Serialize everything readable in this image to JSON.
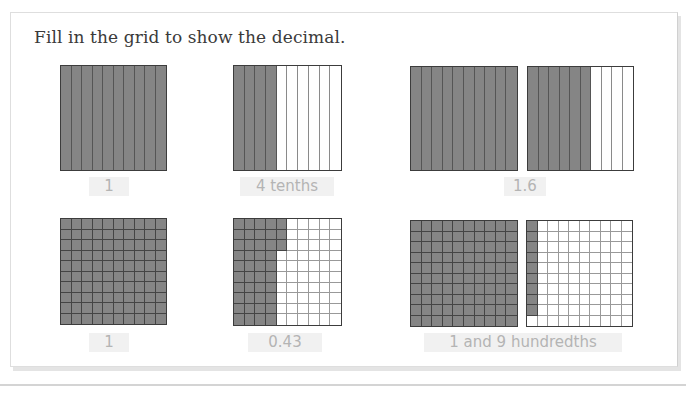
{
  "title": "Fill in the grid to show the decimal.",
  "colors": {
    "shaded": "#858585",
    "border": "#3c3c3c",
    "label_bg": "#f1f1f1",
    "label_text": "#b4b4b4"
  },
  "problems": [
    {
      "id": "a",
      "type": "tenths",
      "grids": [
        {
          "shaded": 10
        }
      ],
      "answer": "1"
    },
    {
      "id": "b",
      "type": "tenths",
      "grids": [
        {
          "shaded": 4
        }
      ],
      "answer": "4 tenths"
    },
    {
      "id": "c",
      "type": "tenths",
      "grids": [
        {
          "shaded": 10
        },
        {
          "shaded": 6
        }
      ],
      "answer": "1.6"
    },
    {
      "id": "d",
      "type": "hundredths",
      "grids": [
        {
          "shaded": 100
        }
      ],
      "answer": "1"
    },
    {
      "id": "e",
      "type": "hundredths",
      "grids": [
        {
          "shaded": 43
        }
      ],
      "answer": "0.43"
    },
    {
      "id": "f",
      "type": "hundredths",
      "grids": [
        {
          "shaded": 100
        },
        {
          "shaded": 9
        }
      ],
      "answer": "1 and 9 hundredths"
    }
  ]
}
